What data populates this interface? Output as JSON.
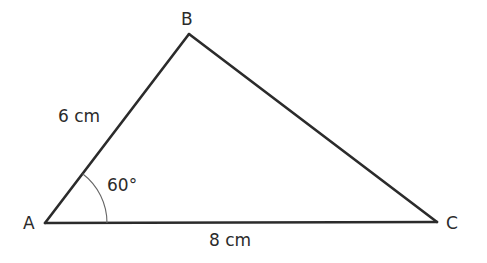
{
  "diagram": {
    "type": "triangle",
    "vertices": {
      "A": {
        "label": "A",
        "x": 45,
        "y": 223
      },
      "B": {
        "label": "B",
        "x": 189,
        "y": 34
      },
      "C": {
        "label": "C",
        "x": 437,
        "y": 222
      }
    },
    "sides": {
      "AB": {
        "label": "6 cm"
      },
      "AC": {
        "label": "8 cm"
      },
      "BC": {
        "label": ""
      }
    },
    "angles": {
      "A": {
        "label": "60°"
      }
    },
    "colors": {
      "stroke": "#2b2b2b",
      "arc": "#666666",
      "text": "#2b2b2b",
      "background": "#ffffff"
    }
  }
}
